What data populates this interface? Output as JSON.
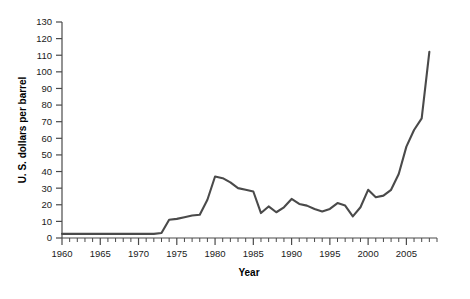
{
  "chart_data": {
    "type": "line",
    "title": "",
    "xlabel": "Year",
    "ylabel": "U. S. dollars per barrel",
    "xlim": [
      1960,
      2009
    ],
    "ylim": [
      0,
      130
    ],
    "grid": false,
    "legend": null,
    "legend_position": "none",
    "line_color": "#4a4a4a",
    "x_major_ticks": [
      1960,
      1965,
      1970,
      1975,
      1980,
      1985,
      1990,
      1995,
      2000,
      2005
    ],
    "x_major_tick_labels": [
      "1960",
      "1965",
      "1970",
      "1975",
      "1980",
      "1985",
      "1990",
      "1995",
      "2000",
      "2005"
    ],
    "x_minor_tick_step": 1,
    "y_ticks": [
      0,
      10,
      20,
      30,
      40,
      50,
      60,
      70,
      80,
      90,
      100,
      110,
      120,
      130
    ],
    "y_tick_labels": [
      "0",
      "10",
      "20",
      "30",
      "40",
      "50",
      "60",
      "70",
      "80",
      "90",
      "100",
      "110",
      "120",
      "130"
    ],
    "series": [
      {
        "name": "Crude oil price",
        "x": [
          1960,
          1961,
          1962,
          1963,
          1964,
          1965,
          1966,
          1967,
          1968,
          1969,
          1970,
          1971,
          1972,
          1973,
          1974,
          1975,
          1976,
          1977,
          1978,
          1979,
          1980,
          1981,
          1982,
          1983,
          1984,
          1985,
          1986,
          1987,
          1988,
          1989,
          1990,
          1991,
          1992,
          1993,
          1994,
          1995,
          1996,
          1997,
          1998,
          1999,
          2000,
          2001,
          2002,
          2003,
          2004,
          2005,
          2006,
          2007,
          2008
        ],
        "values": [
          2.5,
          2.5,
          2.5,
          2.5,
          2.5,
          2.5,
          2.5,
          2.5,
          2.5,
          2.5,
          2.5,
          2.5,
          2.5,
          3.0,
          11.0,
          11.5,
          12.5,
          13.5,
          14.0,
          23.0,
          37.0,
          36.0,
          33.5,
          30.0,
          29.0,
          28.0,
          15.0,
          19.0,
          15.5,
          18.5,
          23.5,
          20.5,
          19.5,
          17.5,
          16.0,
          17.5,
          21.0,
          19.5,
          13.0,
          18.5,
          29.0,
          24.5,
          25.5,
          29.0,
          38.5,
          55.0,
          65.0,
          72.0,
          112.0
        ]
      }
    ]
  },
  "axis": {
    "y_title": "U. S. dollars per barrel",
    "x_title": "Year"
  }
}
